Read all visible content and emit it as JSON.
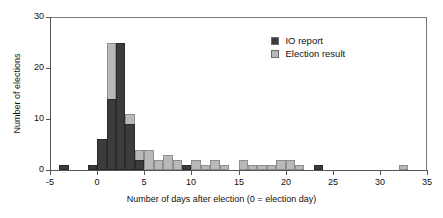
{
  "chart_data": {
    "type": "bar",
    "title": "",
    "subtitle": "",
    "xlabel": "Number of days after election (0 = election day)",
    "ylabel": "Number of elections",
    "xlim": [
      -5,
      35
    ],
    "ylim": [
      0,
      30
    ],
    "xticks": [
      -5,
      0,
      5,
      10,
      15,
      20,
      25,
      30,
      35
    ],
    "xtick_labels": [
      "-5",
      "0",
      "5",
      "10",
      "15",
      "20",
      "25",
      "30",
      "35"
    ],
    "yticks": [
      0,
      10,
      20,
      30
    ],
    "ytick_labels": [
      "0",
      "10",
      "20",
      "30"
    ],
    "grid": false,
    "legend_position": "top-right",
    "bin_width": 1,
    "overlap_mode": "overlaid",
    "series": [
      {
        "name": "IO report",
        "color": "#3c3c3c",
        "x": [
          -4,
          -1,
          0,
          1,
          2,
          3,
          4,
          9,
          23
        ],
        "values": [
          1,
          1,
          6,
          14,
          25,
          9,
          2,
          1,
          1
        ]
      },
      {
        "name": "Election result",
        "color": "#b9b9b9",
        "x": [
          1,
          2,
          3,
          4,
          5,
          6,
          7,
          8,
          10,
          11,
          12,
          13,
          15,
          16,
          17,
          18,
          19,
          20,
          21,
          32
        ],
        "values": [
          25,
          25,
          11,
          4,
          4,
          2,
          3,
          2,
          2,
          1,
          2,
          1,
          2,
          1,
          1,
          1,
          2,
          2,
          1,
          1
        ]
      }
    ]
  },
  "legend": {
    "entries": [
      {
        "label": "IO report",
        "color": "#3c3c3c"
      },
      {
        "label": "Election result",
        "color": "#b9b9b9"
      }
    ]
  },
  "axes": {
    "x_title": "Number of days after election (0 = election day)",
    "y_title": "Number of elections"
  }
}
